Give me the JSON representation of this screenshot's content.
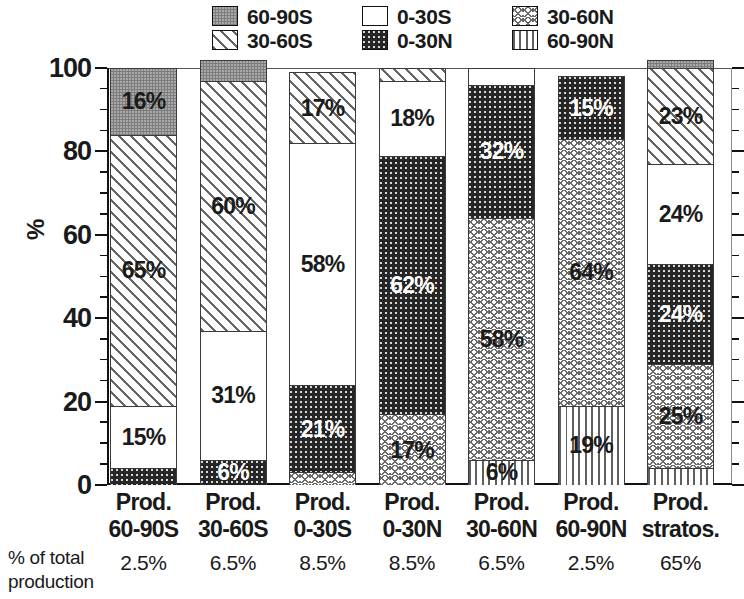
{
  "chart_data": {
    "type": "bar",
    "title": "",
    "subtitle": "",
    "xlabel": "",
    "ylabel": "%",
    "ylim": [
      0,
      100
    ],
    "yticks": [
      0,
      20,
      40,
      60,
      80,
      100
    ],
    "ytick_labels": [
      "0",
      "20",
      "40",
      "60",
      "80",
      "100"
    ],
    "minor_tick_step": 5,
    "grid": false,
    "stacked": true,
    "legend_position": "top",
    "bar_order_bottom_to_top": [
      "60-90N",
      "30-60N",
      "0-30N",
      "0-30S",
      "30-60S",
      "60-90S"
    ],
    "categories": [
      "Prod. 60-90S",
      "Prod. 30-60S",
      "Prod. 0-30S",
      "Prod. 0-30N",
      "Prod. 30-60N",
      "Prod. 60-90N",
      "Prod. stratos."
    ],
    "category_lines": [
      [
        "Prod.",
        "60-90S"
      ],
      [
        "Prod.",
        "30-60S"
      ],
      [
        "Prod.",
        "0-30S"
      ],
      [
        "Prod.",
        "0-30N"
      ],
      [
        "Prod.",
        "30-60N"
      ],
      [
        "Prod.",
        "60-90N"
      ],
      [
        "Prod.",
        "stratos."
      ]
    ],
    "series": [
      {
        "name": "60-90S",
        "pattern": "gray",
        "values": [
          16,
          5,
          0,
          0,
          0,
          0,
          2
        ]
      },
      {
        "name": "30-60S",
        "pattern": "diag",
        "values": [
          65,
          60,
          17,
          3,
          0,
          0,
          23
        ]
      },
      {
        "name": "0-30S",
        "pattern": "white",
        "values": [
          15,
          31,
          58,
          18,
          4,
          0,
          24
        ]
      },
      {
        "name": "0-30N",
        "pattern": "black",
        "values": [
          4,
          6,
          21,
          62,
          32,
          15,
          24
        ]
      },
      {
        "name": "30-60N",
        "pattern": "cross",
        "values": [
          0,
          0,
          3,
          17,
          58,
          64,
          25
        ]
      },
      {
        "name": "60-90N",
        "pattern": "vert",
        "values": [
          0,
          0,
          0,
          0,
          6,
          19,
          4
        ]
      }
    ],
    "footer_label_lines": [
      "% of total",
      "production"
    ],
    "footer_values": [
      "2.5%",
      "6.5%",
      "8.5%",
      "8.5%",
      "6.5%",
      "2.5%",
      "65%"
    ]
  },
  "legend": {
    "items": [
      {
        "label": "60-90S",
        "pattern": "gray",
        "color": "#7d7d7d"
      },
      {
        "label": "30-60S",
        "pattern": "diag",
        "color": "#ffffff"
      },
      {
        "label": "0-30S",
        "pattern": "white",
        "color": "#ffffff"
      },
      {
        "label": "0-30N",
        "pattern": "black",
        "color": "#262626"
      },
      {
        "label": "30-60N",
        "pattern": "cross",
        "color": "#ffffff"
      },
      {
        "label": "60-90N",
        "pattern": "vert",
        "color": "#ffffff"
      }
    ]
  }
}
